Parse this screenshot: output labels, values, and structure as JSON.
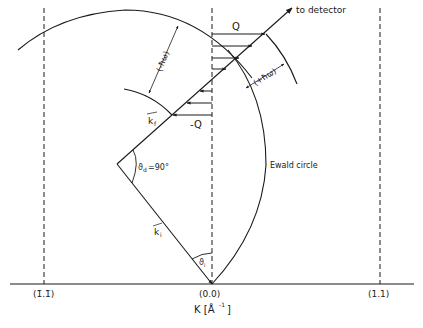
{
  "figure": {
    "type": "Ewald circle scattering diagram",
    "labels": {
      "to_detector": "to detector",
      "q": "Q",
      "minus_q": "-Q",
      "kf": "k",
      "kf_sub": "f",
      "ki": "k",
      "ki_sub": "i",
      "theta_d": "ϑ",
      "theta_d_sub": "d",
      "theta_d_value": "=90°",
      "theta_i": "ϑ",
      "theta_i_sub": "i",
      "minus_hw": "(-ħω)",
      "plus_hw": "(+ħω)",
      "ewald_circle": "Ewald circle"
    },
    "axis": {
      "label": "K [Å",
      "label_exp": "-1",
      "label_close": "]",
      "ticks": [
        {
          "label": "(1̄.1̄)"
        },
        {
          "label": "(0.0)"
        },
        {
          "label": "(1.1)"
        }
      ]
    },
    "colors": {
      "ink": "#1a1a1a",
      "background": "#ffffff"
    }
  }
}
